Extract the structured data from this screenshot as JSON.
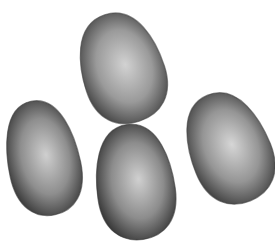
{
  "image": {
    "subject": "four grey eggs",
    "background": "#ffffff",
    "eggs": [
      {
        "name": "top-egg",
        "cx": 122,
        "cy": 68,
        "rx": 41,
        "ry": 56,
        "rotate": -18,
        "fill": "#9a9a9a",
        "highlight": "#d2d2d2",
        "edge": "#4a4a4a"
      },
      {
        "name": "left-egg",
        "cx": 43,
        "cy": 158,
        "rx": 36,
        "ry": 58,
        "rotate": -12,
        "fill": "#8e8e8e",
        "highlight": "#cfcfcf",
        "edge": "#3e3e3e"
      },
      {
        "name": "bottom-egg",
        "cx": 135,
        "cy": 182,
        "rx": 39,
        "ry": 58,
        "rotate": -8,
        "fill": "#8c8c8c",
        "highlight": "#d0d0d0",
        "edge": "#3a3a3a"
      },
      {
        "name": "right-egg",
        "cx": 229,
        "cy": 148,
        "rx": 40,
        "ry": 57,
        "rotate": -22,
        "fill": "#959595",
        "highlight": "#d6d6d6",
        "edge": "#454545"
      }
    ]
  }
}
